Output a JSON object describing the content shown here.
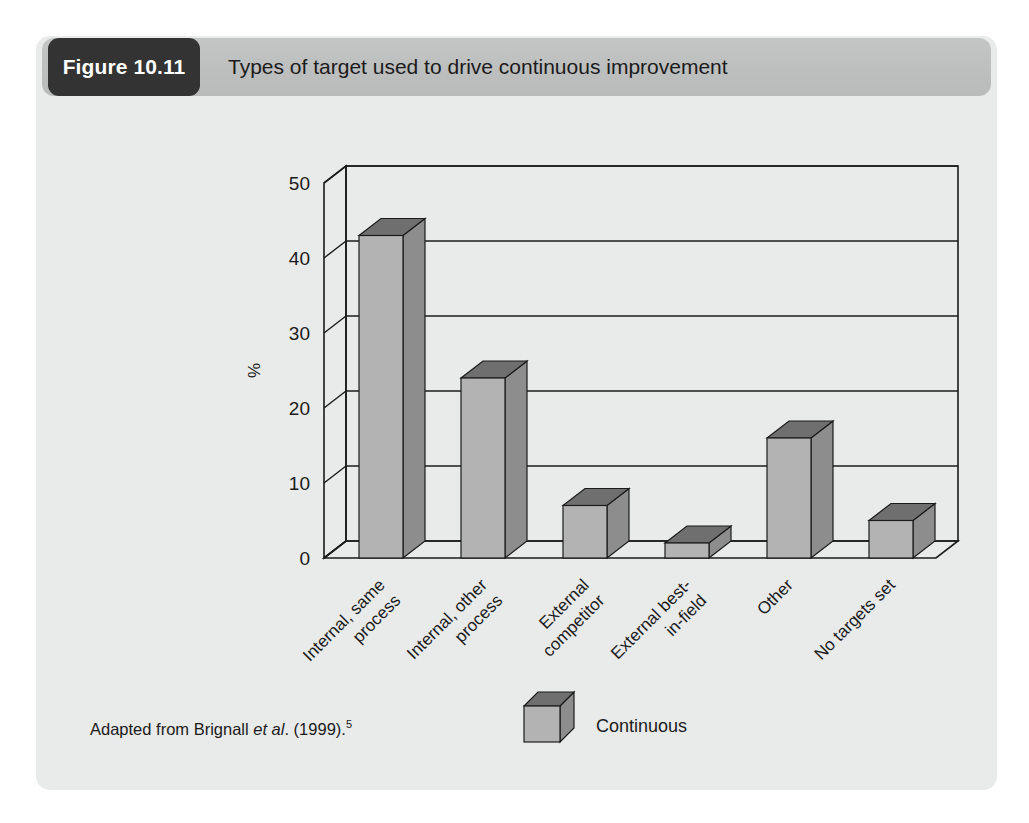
{
  "figure": {
    "badge_label": "Figure 10.11",
    "title": "Types of target used to drive continuous improvement",
    "source_prefix": "Adapted from Brignall ",
    "source_italic": "et al",
    "source_suffix": ". (1999).",
    "source_superscript": "5"
  },
  "legend": {
    "series_label": "Continuous"
  },
  "colors": {
    "card_background": "#e9eaea",
    "header_band": "#bdbebe",
    "badge_background": "#333333",
    "badge_text": "#ffffff",
    "bar_front": "#b3b3b3",
    "bar_top": "#6f6f6f",
    "bar_side": "#8d8d8d",
    "axis_line": "#1b1b1b",
    "text": "#1b1b1b"
  },
  "chart_data": {
    "type": "bar",
    "title": "Types of target used to drive continuous improvement",
    "xlabel": "",
    "ylabel": "%",
    "ylim": [
      0,
      50
    ],
    "yticks": [
      0,
      10,
      20,
      30,
      40,
      50
    ],
    "ytick_labels": [
      "0",
      "10",
      "20",
      "30",
      "40",
      "50"
    ],
    "grid": true,
    "grid_axis": "y",
    "legend_position": "bottom-center",
    "three_d": true,
    "categories": [
      "Internal, same process",
      "Internal, other process",
      "External competitor",
      "External best-in-field",
      "Other",
      "No targets set"
    ],
    "category_lines": [
      [
        "Internal, same",
        "process"
      ],
      [
        "Internal, other",
        "process"
      ],
      [
        "External",
        "competitor"
      ],
      [
        "External best-",
        "in-field"
      ],
      [
        "Other"
      ],
      [
        "No targets set"
      ]
    ],
    "series": [
      {
        "name": "Continuous",
        "values": [
          43,
          24,
          7,
          2,
          16,
          5
        ]
      }
    ]
  }
}
